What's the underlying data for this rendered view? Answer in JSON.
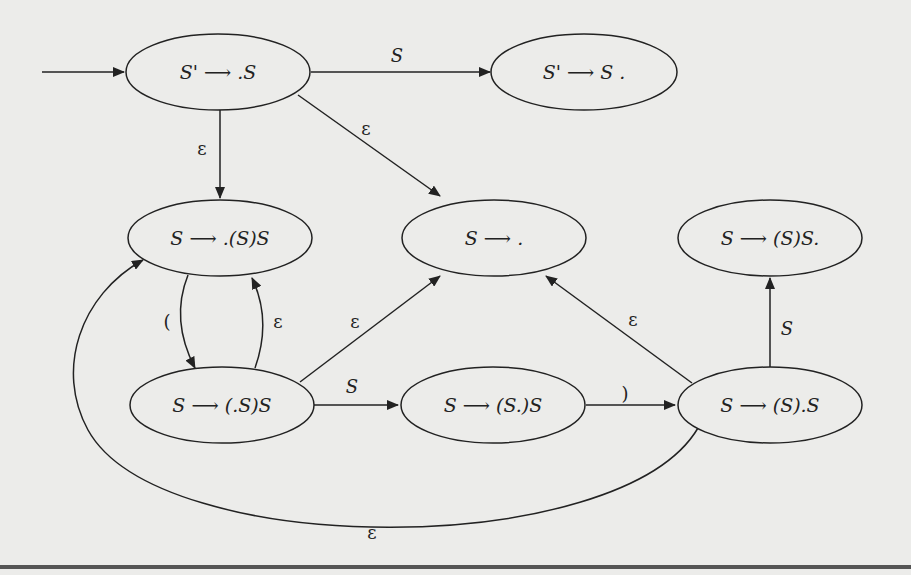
{
  "diagram": {
    "colors": {
      "background": "#ececea",
      "stroke": "#222222"
    },
    "nodes": [
      {
        "id": "n0",
        "lhs": "S'",
        "arrow": "⟶",
        "rhs": ".S",
        "start": true
      },
      {
        "id": "n1",
        "lhs": "S'",
        "arrow": "⟶",
        "rhs": "S ."
      },
      {
        "id": "n2",
        "lhs": "S",
        "arrow": "⟶",
        "rhs": ".(S)S"
      },
      {
        "id": "n3",
        "lhs": "S",
        "arrow": "⟶",
        "rhs": " ."
      },
      {
        "id": "n4",
        "lhs": "S",
        "arrow": "⟶",
        "rhs": "(S)S."
      },
      {
        "id": "n5",
        "lhs": "S",
        "arrow": "⟶",
        "rhs": "(.S)S"
      },
      {
        "id": "n6",
        "lhs": "S",
        "arrow": "⟶",
        "rhs": "(S.)S"
      },
      {
        "id": "n7",
        "lhs": "S",
        "arrow": "⟶",
        "rhs": "(S).S"
      }
    ],
    "edges": [
      {
        "from": "start",
        "to": "n0",
        "label": ""
      },
      {
        "from": "n0",
        "to": "n1",
        "label": "S"
      },
      {
        "from": "n0",
        "to": "n2",
        "label": "ε"
      },
      {
        "from": "n0",
        "to": "n3",
        "label": "ε"
      },
      {
        "from": "n2",
        "to": "n5",
        "label": "("
      },
      {
        "from": "n5",
        "to": "n2",
        "label": "ε"
      },
      {
        "from": "n5",
        "to": "n3",
        "label": "ε"
      },
      {
        "from": "n5",
        "to": "n6",
        "label": "S"
      },
      {
        "from": "n6",
        "to": "n7",
        "label": ")"
      },
      {
        "from": "n7",
        "to": "n3",
        "label": "ε"
      },
      {
        "from": "n7",
        "to": "n4",
        "label": "S"
      },
      {
        "from": "n7",
        "to": "n2",
        "label": "ε"
      }
    ]
  }
}
